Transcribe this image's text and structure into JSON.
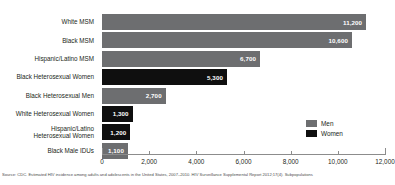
{
  "chart_data": {
    "type": "bar",
    "orientation": "horizontal",
    "title": "",
    "subtitle": "",
    "xlabel": "",
    "ylabel": "",
    "xlim": [
      0,
      12000
    ],
    "grid": false,
    "legend_position": "inside-bottom-right",
    "categories": [
      "White MSM",
      "Black MSM",
      "Hispanic/Latino MSM",
      "Black Heterosexual Women",
      "Black Heterosexual Men",
      "White Heterosexual Women",
      "Hispanic/Latino\nHeterosexual Women",
      "Black Male IDUs"
    ],
    "values": [
      11200,
      10600,
      6700,
      5300,
      2700,
      1300,
      1200,
      1100
    ],
    "value_labels": [
      "11,200",
      "10,600",
      "6,700",
      "5,300",
      "2,700",
      "1,300",
      "1,200",
      "1,100"
    ],
    "group": [
      "Men",
      "Men",
      "Men",
      "Women",
      "Men",
      "Women",
      "Women",
      "Men"
    ],
    "series": [
      {
        "name": "Men",
        "color": "#6d6e70"
      },
      {
        "name": "Women",
        "color": "#0f0f0f"
      }
    ],
    "xticks": [
      0,
      2000,
      4000,
      6000,
      8000,
      10000,
      12000
    ],
    "xtick_labels": [
      "0",
      "2,000",
      "4,000",
      "6,000",
      "8,000",
      "10,000",
      "12,000"
    ],
    "source": "Source: CDC. Estimated HIV incidence among adults and adolescents in the United States, 2007–2010. HIV Surveillance Supplemental Report 2012;17(4). Subpopulations"
  },
  "legend": {
    "items": [
      {
        "label": "Men",
        "color": "#6d6e70"
      },
      {
        "label": "Women",
        "color": "#0f0f0f"
      }
    ]
  }
}
